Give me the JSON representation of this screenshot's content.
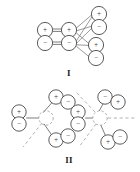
{
  "figure": {
    "background_color": "#ffffff",
    "stroke_color": "#5a5a5a",
    "dash_color": "#9a9a9a",
    "text_color": "#1a1a1a",
    "width": 140,
    "height": 172,
    "signs": {
      "plus": "+",
      "minus": "−"
    },
    "structures": [
      {
        "id": "structure-I",
        "label": "I",
        "label_x": 69,
        "label_y": 73,
        "description": "Stacked dipole pair chain with two branching dipole pairs on the right",
        "nodes": [
          {
            "name": "left-upper-plus",
            "sign": "+",
            "cx": 45,
            "cy": 30,
            "r": 7.6
          },
          {
            "name": "left-lower-minus",
            "sign": "−",
            "cx": 45,
            "cy": 43,
            "r": 7.6
          },
          {
            "name": "center-upper-plus",
            "sign": "+",
            "cx": 69,
            "cy": 30,
            "r": 7.6
          },
          {
            "name": "center-lower-minus",
            "sign": "−",
            "cx": 69,
            "cy": 43,
            "r": 7.6
          },
          {
            "name": "top-right-plus",
            "sign": "+",
            "cx": 99,
            "cy": 14,
            "r": 7.6
          },
          {
            "name": "top-right-minus",
            "sign": "−",
            "cx": 99,
            "cy": 27,
            "r": 7.6
          },
          {
            "name": "bot-right-plus",
            "sign": "+",
            "cx": 96,
            "cy": 45,
            "r": 7.6
          },
          {
            "name": "bot-right-minus",
            "sign": "−",
            "cx": 96,
            "cy": 58,
            "r": 7.6
          }
        ],
        "bonds": [
          {
            "name": "bond-left-upper-to-center-upper",
            "x1": 52.6,
            "y1": 29.0,
            "x2": 61.4,
            "y2": 29.0
          },
          {
            "name": "bond-left-upper-to-center-upper-b",
            "x1": 52.6,
            "y1": 31.4,
            "x2": 61.4,
            "y2": 31.4
          },
          {
            "name": "bond-left-lower-to-center-lower",
            "x1": 52.6,
            "y1": 42.0,
            "x2": 61.4,
            "y2": 42.0
          },
          {
            "name": "bond-left-lower-to-center-lower-b",
            "x1": 52.6,
            "y1": 44.4,
            "x2": 61.4,
            "y2": 44.4
          },
          {
            "name": "bond-center-upper-to-top-right-plus",
            "x1": 76.4,
            "y1": 28.5,
            "x2": 91.6,
            "y2": 15.2
          },
          {
            "name": "bond-center-upper-to-top-right-minus",
            "x1": 76.4,
            "y1": 31.0,
            "x2": 91.6,
            "y2": 26.4
          },
          {
            "name": "bond-center-lower-to-top-right-plus",
            "x1": 76.4,
            "y1": 41.4,
            "x2": 91.6,
            "y2": 16.6
          },
          {
            "name": "bond-center-lower-to-top-right-minus",
            "x1": 76.4,
            "y1": 43.6,
            "x2": 91.6,
            "y2": 28.0
          },
          {
            "name": "bond-center-upper-to-bot-right-plus",
            "x1": 76.4,
            "y1": 32.4,
            "x2": 88.8,
            "y2": 44.0
          },
          {
            "name": "bond-center-lower-to-bot-right-plus",
            "x1": 76.4,
            "y1": 45.0,
            "x2": 88.8,
            "y2": 45.6
          },
          {
            "name": "bond-center-lower-to-bot-right-minus",
            "x1": 76.4,
            "y1": 46.2,
            "x2": 88.8,
            "y2": 57.0
          }
        ]
      },
      {
        "id": "structure-II-left",
        "label": "",
        "description": "Tripod dipole arrangement, left enantiomer, dashed central sphere and dashed axis to lower left",
        "center": {
          "name": "central-dashed-sphere",
          "cx": 46,
          "cy": 118,
          "r": 7.2
        },
        "dashed_axes": [
          {
            "name": "axis-lower-left",
            "x1": 42.0,
            "y1": 123.0,
            "x2": 24.0,
            "y2": 146.0
          }
        ],
        "nodes": [
          {
            "name": "left-plus",
            "sign": "+",
            "cx": 19,
            "cy": 112,
            "r": 7.2
          },
          {
            "name": "left-minus",
            "sign": "−",
            "cx": 19,
            "cy": 124,
            "r": 7.2
          },
          {
            "name": "upper-plus",
            "sign": "+",
            "cx": 56,
            "cy": 97,
            "r": 7.2
          },
          {
            "name": "upper-minus",
            "sign": "−",
            "cx": 68,
            "cy": 102,
            "r": 7.2
          },
          {
            "name": "lower-plus",
            "sign": "+",
            "cx": 56,
            "cy": 140,
            "r": 7.2
          },
          {
            "name": "lower-minus",
            "sign": "−",
            "cx": 68,
            "cy": 136,
            "r": 7.2
          }
        ],
        "bonds": [
          {
            "name": "bond-center-to-left",
            "x1": 38.8,
            "y1": 118.0,
            "x2": 26.2,
            "y2": 118.0
          },
          {
            "name": "bond-center-to-upper",
            "x1": 43.0,
            "y1": 112.5,
            "x2": 52.0,
            "y2": 102.6
          },
          {
            "name": "bond-center-to-lower",
            "x1": 43.8,
            "y1": 123.8,
            "x2": 51.6,
            "y2": 134.4
          },
          {
            "name": "bond-upper-pair",
            "x1": 62.6,
            "y1": 99.2,
            "x2": 61.6,
            "y2": 99.8
          },
          {
            "name": "bond-lower-pair",
            "x1": 62.6,
            "y1": 138.0,
            "x2": 61.6,
            "y2": 137.6
          }
        ]
      },
      {
        "id": "structure-II-right",
        "label": "",
        "description": "Tripod dipole arrangement, right enantiomer (mirror image), dashed axes upper-left, right and lower-left",
        "center": {
          "name": "central-dashed-sphere",
          "cx": 100,
          "cy": 118,
          "r": 7.2
        },
        "dashed_axes": [
          {
            "name": "axis-upper-left",
            "x1": 95.0,
            "y1": 112.0,
            "x2": 76.0,
            "y2": 92.0
          },
          {
            "name": "axis-right",
            "x1": 108.0,
            "y1": 118.0,
            "x2": 134.0,
            "y2": 118.0
          },
          {
            "name": "axis-lower-left",
            "x1": 96.0,
            "y1": 124.0,
            "x2": 80.0,
            "y2": 146.0
          }
        ],
        "nodes": [
          {
            "name": "left-plus",
            "sign": "+",
            "cx": 78,
            "cy": 112,
            "r": 7.2
          },
          {
            "name": "left-minus",
            "sign": "−",
            "cx": 78,
            "cy": 124,
            "r": 7.2
          },
          {
            "name": "upper-minus",
            "sign": "−",
            "cx": 105,
            "cy": 97,
            "r": 7.2
          },
          {
            "name": "upper-plus",
            "sign": "+",
            "cx": 118,
            "cy": 102,
            "r": 7.2
          },
          {
            "name": "lower-plus",
            "sign": "+",
            "cx": 108,
            "cy": 142,
            "r": 7.2
          },
          {
            "name": "lower-minus",
            "sign": "−",
            "cx": 120,
            "cy": 137,
            "r": 7.2
          }
        ],
        "bonds": [
          {
            "name": "bond-center-to-left",
            "x1": 92.8,
            "y1": 118.0,
            "x2": 85.2,
            "y2": 118.0
          },
          {
            "name": "bond-center-to-upper",
            "x1": 99.0,
            "y1": 111.0,
            "x2": 103.0,
            "y2": 103.4
          },
          {
            "name": "bond-center-to-lower",
            "x1": 100.5,
            "y1": 125.2,
            "x2": 105.0,
            "y2": 135.4
          },
          {
            "name": "bond-upper-pair",
            "x1": 111.6,
            "y1": 99.0,
            "x2": 111.4,
            "y2": 99.6
          },
          {
            "name": "bond-lower-pair",
            "x1": 114.6,
            "y1": 139.8,
            "x2": 113.4,
            "y2": 139.6
          }
        ]
      }
    ],
    "labels": [
      {
        "name": "label-structure-I",
        "text": "I",
        "x": 69,
        "y": 73
      },
      {
        "name": "label-structure-II",
        "text": "II",
        "x": 69,
        "y": 160
      }
    ]
  }
}
